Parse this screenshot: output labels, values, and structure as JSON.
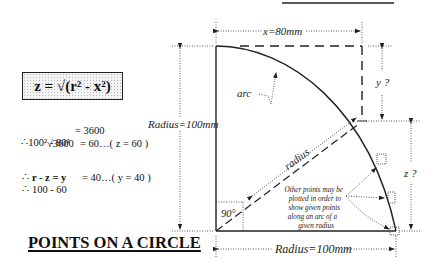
{
  "diagram": {
    "title": "POINTS ON A CIRCLE",
    "formula": {
      "text": "z = √(r² - x²)"
    },
    "calculations": [
      {
        "prefix": "∴",
        "lhs": "100² - 80²",
        "rhs": "= 3600"
      },
      {
        "prefix": "",
        "lhs": "√3600",
        "rhs": "= 60…( z = 60 )"
      },
      {
        "prefix": "∴",
        "lhs": "r - z = y",
        "rhs": "",
        "bold": true
      },
      {
        "prefix": "∴",
        "lhs": "100 - 60",
        "rhs": "= 40…( y = 40 )"
      }
    ],
    "labels": {
      "x_dimension": "x=80mm",
      "y_dimension": "y ?",
      "z_dimension": "z ?",
      "radius_vertical": "Radius=100mm",
      "radius_horizontal": "Radius=100mm",
      "radius_line": "radius",
      "arc": "arc",
      "right_angle": "90°",
      "note_lines": [
        "Other points may be",
        "plotted in order to",
        "show given points",
        "along an arc of a",
        "given radius"
      ]
    },
    "values": {
      "radius_mm": 100,
      "x_mm": 80,
      "z_mm": 60,
      "y_mm": 40,
      "angle_deg": 90
    }
  }
}
